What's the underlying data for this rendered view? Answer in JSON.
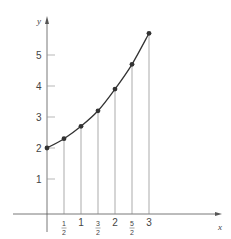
{
  "chart_data": {
    "type": "line",
    "title": "",
    "xlabel": "x",
    "ylabel": "y",
    "x_tick_labels": [
      "1/2",
      "1",
      "3/2",
      "2",
      "5/2",
      "3"
    ],
    "y_tick_labels": [
      "1",
      "2",
      "3",
      "4",
      "5"
    ],
    "x": [
      0,
      0.5,
      1,
      1.5,
      2,
      2.5,
      3
    ],
    "values": [
      2.0,
      2.3,
      2.7,
      3.2,
      3.9,
      4.7,
      5.7
    ],
    "xlim": [
      -0.5,
      5.0
    ],
    "ylim": [
      -1,
      6
    ],
    "grid": false,
    "markers": true,
    "vertical_drop_lines": true,
    "colors": {
      "curve": "#333333",
      "axis": "#555555",
      "drop_lines": "#888888"
    }
  }
}
